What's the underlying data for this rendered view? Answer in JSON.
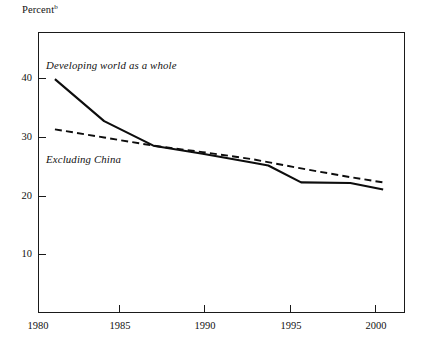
{
  "chart_data": {
    "type": "line",
    "title": "Percent",
    "title_superscript": "b",
    "xlabel": "",
    "ylabel": "",
    "xlim": [
      1980,
      2002.3
    ],
    "ylim": [
      0,
      48
    ],
    "grid": false,
    "legend_position": "inline-annotations",
    "x_ticks": [
      1980,
      1985,
      1990,
      1995,
      2000
    ],
    "x_tick_labels": [
      "1980",
      "1985",
      "1990",
      "1995",
      "2000"
    ],
    "y_ticks": [
      10,
      20,
      30,
      40
    ],
    "y_tick_labels": [
      "10",
      "20",
      "30",
      "40"
    ],
    "series": [
      {
        "name": "Developing world as a whole",
        "style": "solid",
        "color": "#0d0d0d",
        "x": [
          1981,
          1984,
          1987,
          1990,
          1993,
          1994,
          1996,
          1999,
          2001
        ],
        "values": [
          40.0,
          32.8,
          28.6,
          27.2,
          25.7,
          25.2,
          22.3,
          22.2,
          21.1
        ]
      },
      {
        "name": "Excluding China",
        "style": "dashed",
        "color": "#0d0d0d",
        "x": [
          1981,
          1984,
          1987,
          1990,
          1993,
          1996,
          1999,
          2001
        ],
        "values": [
          31.4,
          30.0,
          28.6,
          27.5,
          26.3,
          24.7,
          23.2,
          22.3
        ]
      }
    ],
    "annotations": [
      {
        "text": "Developing world as a whole",
        "x_px": 46,
        "y_px": 59
      },
      {
        "text": "Excluding China",
        "x_px": 46,
        "y_px": 153
      }
    ]
  },
  "colors": {
    "ink": "#0d0d0d",
    "frame": "#1a1a1a",
    "background": "#ffffff"
  }
}
